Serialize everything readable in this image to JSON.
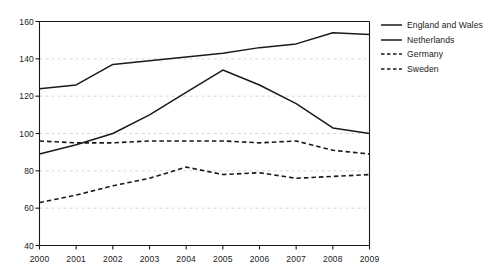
{
  "chart_data": {
    "type": "line",
    "title": "",
    "subtitle": "",
    "xlabel": "",
    "ylabel": "",
    "x": [
      2000,
      2001,
      2002,
      2003,
      2004,
      2005,
      2006,
      2007,
      2008,
      2009
    ],
    "xtick_labels": [
      "2000",
      "2001",
      "2002",
      "2003",
      "2004",
      "2005",
      "2006",
      "2007",
      "2008",
      "2009"
    ],
    "ytick_labels": [
      "40",
      "60",
      "80",
      "100",
      "120",
      "140",
      "160"
    ],
    "yticks": [
      40,
      60,
      80,
      100,
      120,
      140,
      160
    ],
    "xlim": [
      2000,
      2009
    ],
    "ylim": [
      40,
      160
    ],
    "grid": true,
    "grid_axis": "y",
    "legend_position": "right",
    "series": [
      {
        "name": "England and Wales",
        "style": "solid",
        "color": "#1a1a1a",
        "values": [
          124,
          126,
          137,
          139,
          141,
          143,
          146,
          148,
          154,
          153
        ]
      },
      {
        "name": "Netherlands",
        "style": "solid",
        "color": "#1a1a1a",
        "values": [
          89,
          94,
          100,
          110,
          122,
          134,
          126,
          116,
          103,
          100
        ]
      },
      {
        "name": "Germany",
        "style": "dashed",
        "color": "#1a1a1a",
        "values": [
          96,
          95,
          95,
          96,
          96,
          96,
          95,
          96,
          91,
          89
        ]
      },
      {
        "name": "Sweden",
        "style": "dashed",
        "color": "#1a1a1a",
        "values": [
          63,
          67,
          72,
          76,
          82,
          78,
          79,
          76,
          77,
          78
        ]
      }
    ]
  },
  "axes": {
    "frame_color": "#1a1a1a",
    "grid_color": "#d8d8d8"
  },
  "legend": {
    "items": [
      {
        "label": "England and Wales",
        "style": "solid"
      },
      {
        "label": "Netherlands",
        "style": "solid"
      },
      {
        "label": "Germany",
        "style": "dashed"
      },
      {
        "label": "Sweden",
        "style": "dashed"
      }
    ]
  }
}
